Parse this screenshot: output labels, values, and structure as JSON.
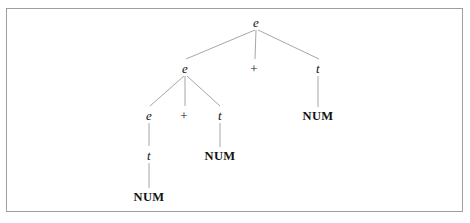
{
  "figure": {
    "kind": "parse-tree",
    "caption": "",
    "background_color": "#ffffff",
    "frame": {
      "border_color": "#9a9a9a",
      "x": 6,
      "y": 8,
      "width": 457,
      "height": 204
    },
    "edge_color": "#9c9c9c",
    "text_color": "#121212"
  },
  "tree": {
    "grammar_note": "",
    "nodes": [
      {
        "id": "n0",
        "label": "e",
        "kind": "nonterminal",
        "x": 256,
        "y": 22,
        "depth": 0
      },
      {
        "id": "n1",
        "label": "e",
        "kind": "nonterminal",
        "x": 185,
        "y": 68,
        "depth": 1
      },
      {
        "id": "n2",
        "label": "+",
        "kind": "operator",
        "x": 254,
        "y": 68,
        "depth": 1
      },
      {
        "id": "n3",
        "label": "t",
        "kind": "nonterminal",
        "x": 318,
        "y": 68,
        "depth": 1
      },
      {
        "id": "n4",
        "label": "e",
        "kind": "nonterminal",
        "x": 149,
        "y": 115,
        "depth": 2
      },
      {
        "id": "n5",
        "label": "+",
        "kind": "operator",
        "x": 184,
        "y": 115,
        "depth": 2
      },
      {
        "id": "n6",
        "label": "t",
        "kind": "nonterminal",
        "x": 220,
        "y": 115,
        "depth": 2
      },
      {
        "id": "n7",
        "label": "NUM",
        "kind": "terminal",
        "x": 318,
        "y": 116,
        "depth": 2
      },
      {
        "id": "n8",
        "label": "t",
        "kind": "nonterminal",
        "x": 149,
        "y": 155,
        "depth": 3
      },
      {
        "id": "n9",
        "label": "NUM",
        "kind": "terminal",
        "x": 220,
        "y": 156,
        "depth": 3
      },
      {
        "id": "n10",
        "label": "NUM",
        "kind": "terminal",
        "x": 149,
        "y": 197,
        "depth": 4
      }
    ],
    "edges": [
      {
        "from": "n0",
        "to": "n1",
        "x1": 255,
        "y1": 30,
        "x2": 186,
        "y2": 59
      },
      {
        "from": "n0",
        "to": "n2",
        "x1": 256,
        "y1": 30,
        "x2": 255,
        "y2": 59
      },
      {
        "from": "n0",
        "to": "n3",
        "x1": 258,
        "y1": 30,
        "x2": 319,
        "y2": 59
      },
      {
        "from": "n1",
        "to": "n4",
        "x1": 184,
        "y1": 76,
        "x2": 150,
        "y2": 106
      },
      {
        "from": "n1",
        "to": "n5",
        "x1": 185,
        "y1": 76,
        "x2": 185,
        "y2": 106
      },
      {
        "from": "n1",
        "to": "n6",
        "x1": 187,
        "y1": 76,
        "x2": 220,
        "y2": 106
      },
      {
        "from": "n3",
        "to": "n7",
        "x1": 318,
        "y1": 76,
        "x2": 318,
        "y2": 107
      },
      {
        "from": "n4",
        "to": "n8",
        "x1": 149,
        "y1": 123,
        "x2": 149,
        "y2": 146
      },
      {
        "from": "n6",
        "to": "n9",
        "x1": 220,
        "y1": 123,
        "x2": 220,
        "y2": 147
      },
      {
        "from": "n8",
        "to": "n10",
        "x1": 149,
        "y1": 163,
        "x2": 149,
        "y2": 188
      }
    ]
  }
}
